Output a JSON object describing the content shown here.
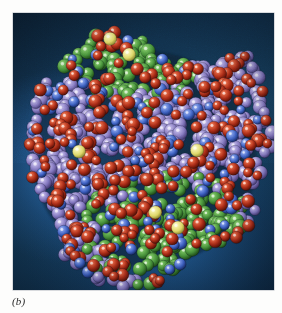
{
  "figure": {
    "caption": "(b)",
    "caption_style": "italic-serif",
    "plate_type": "photograph",
    "page_background": "#fdfdfc"
  },
  "photo": {
    "backdrop_description": "blue studio backdrop, dark navy at the corners brightening to a medium cerulean toward the mid-left and lower centre",
    "backdrop_colors": {
      "corner_dark": "#0d2438",
      "mid_dark": "#11304b",
      "mid_blue": "#17405f",
      "highlight_blue": "#2a68a8",
      "lower_blue": "#225c98"
    },
    "frame": {
      "x": 13,
      "y": 13,
      "width": 261,
      "height": 277,
      "border_color": "#78828c"
    }
  },
  "molecule": {
    "model_type": "space-filling",
    "shape_description": "roughly ovoid globular mass running from upper-left to lower-right, with a narrow arm protruding at the upper right and a ragged fringe of atoms at the lower left",
    "atom_groups": [
      {
        "name": "purple-core",
        "label": "purple / lavender atoms forming the large central core",
        "color": "#8a7fc4",
        "highlight_color": "#cdc6ea",
        "shadow_color": "#4b4280",
        "count": 430
      },
      {
        "name": "red-atoms",
        "label": "red / dark-red atoms distributed across the whole surface",
        "color": "#b8331f",
        "highlight_color": "#f0836a",
        "shadow_color": "#5f1408",
        "count": 240
      },
      {
        "name": "green-domain",
        "label": "green atoms forming the upper-centre and lower-centre domains",
        "color": "#4e9a3e",
        "highlight_color": "#9bd48a",
        "shadow_color": "#23541a",
        "count": 190
      },
      {
        "name": "blue-atoms",
        "label": "bright blue atoms scattered within the green and purple regions",
        "color": "#3f66c8",
        "highlight_color": "#9ab0ef",
        "shadow_color": "#1d3070",
        "count": 95
      },
      {
        "name": "yellow-atoms",
        "label": "pale yellow atoms, five visible, marking bound ligands or cofactors",
        "color": "#e8e27a",
        "highlight_color": "#fbfac8",
        "shadow_color": "#9a9434",
        "count": 5
      }
    ],
    "yellow_marker_positions": [
      {
        "id": "yellow-top-left",
        "x": 0.372,
        "y": 0.093
      },
      {
        "id": "yellow-top-right",
        "x": 0.445,
        "y": 0.15
      },
      {
        "id": "yellow-middle-left",
        "x": 0.253,
        "y": 0.5
      },
      {
        "id": "yellow-middle-right",
        "x": 0.705,
        "y": 0.496
      },
      {
        "id": "yellow-bottom-left",
        "x": 0.545,
        "y": 0.72
      },
      {
        "id": "yellow-bottom-right",
        "x": 0.632,
        "y": 0.775
      }
    ]
  }
}
